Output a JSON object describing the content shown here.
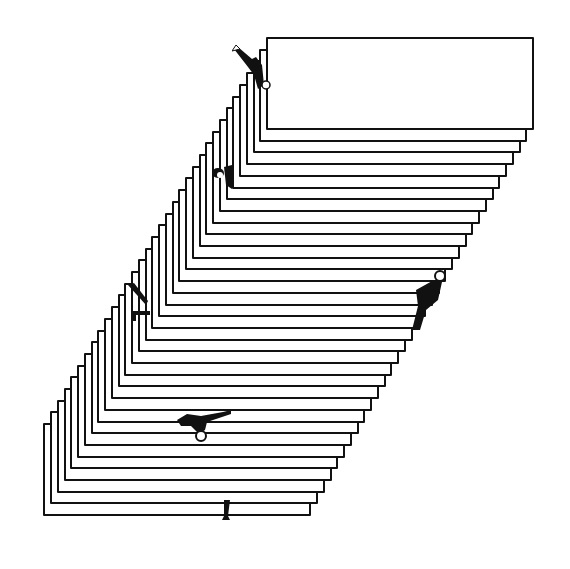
{
  "artwork": {
    "description": "Illustration of a tall staircase-like stack of offset paper sheets with small figures climbing along the edges",
    "background": "#ffffff",
    "ink": "#111111",
    "stack": {
      "count": 34,
      "top_sheet": {
        "x": 266,
        "y": 37,
        "w": 268,
        "h": 93
      },
      "step_dx": -6.75,
      "step_dy": 11.7
    },
    "figures": [
      {
        "name": "figure-top-waving",
        "x": 232,
        "y": 45
      },
      {
        "name": "figure-upper-left",
        "x": 210,
        "y": 165
      },
      {
        "name": "figure-middle-left",
        "x": 128,
        "y": 283
      },
      {
        "name": "figure-right-climbing",
        "x": 412,
        "y": 270
      },
      {
        "name": "figure-lower-reaching",
        "x": 177,
        "y": 410
      },
      {
        "name": "figure-bottom-legs",
        "x": 220,
        "y": 500
      }
    ]
  }
}
